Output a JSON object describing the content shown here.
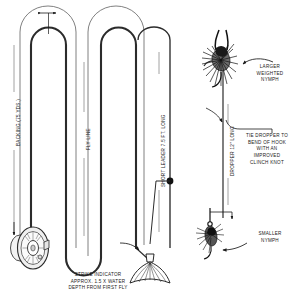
{
  "diagram": {
    "background_color": "#ffffff",
    "line_color": "#2b2b2b",
    "text_color": "#1a1a1a"
  },
  "labels": {
    "backing": "BACKING (75 YDS.)",
    "fly_line": "FLY LINE",
    "short_leader": "SHORT LEADER 7.5 FT. LONG",
    "dropper": "DROPPER 12\" LONG",
    "larger_nymph": "LARGER\nWEIGHTED\nNYMPH",
    "tie_dropper": "TIE DROPPER TO\nBEND OF HOOK\nWITH AN\nIMPROVED\nCLINCH KNOT",
    "smaller_nymph": "SMALLER\nNYMPH",
    "strike_indicator": "STRIKE INDICATOR\nAPPROX. 1.5 X WATER\nDEPTH FROM FIRST FLY"
  },
  "components": {
    "reel": "fly-reel",
    "larger_nymph_fly": "weighted-nymph-fly",
    "smaller_nymph_fly": "small-nymph-fly",
    "strike_indicator_yarn": "yarn-strike-indicator",
    "tippet_knot": "tippet-knot-dot"
  }
}
